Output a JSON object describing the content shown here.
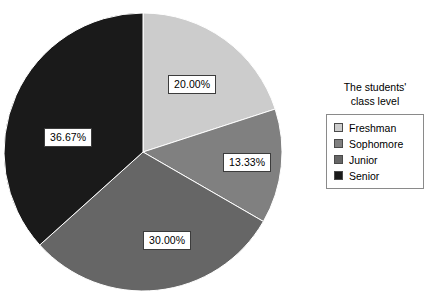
{
  "chart_data": {
    "type": "pie",
    "title": "",
    "legend_title_lines": [
      "The students'",
      "class level"
    ],
    "legend_position": "right",
    "start_angle_deg": 0,
    "direction": "clockwise",
    "categories": [
      "Freshman",
      "Sophomore",
      "Junior",
      "Senior"
    ],
    "values": [
      20.0,
      13.33,
      30.0,
      36.67
    ],
    "value_labels": [
      "20.00%",
      "13.33%",
      "30.00%",
      "36.67%"
    ],
    "colors": [
      "#cccccc",
      "#808080",
      "#666666",
      "#1a1a1a"
    ],
    "slices": [
      {
        "label": "Freshman",
        "value": 20.0,
        "value_label": "20.00%",
        "color": "#cccccc"
      },
      {
        "label": "Sophomore",
        "value": 13.33,
        "value_label": "13.33%",
        "color": "#808080"
      },
      {
        "label": "Junior",
        "value": 30.0,
        "value_label": "30.00%",
        "color": "#666666"
      },
      {
        "label": "Senior",
        "value": 36.67,
        "value_label": "36.67%",
        "color": "#1a1a1a"
      }
    ]
  },
  "legend": {
    "title_line1": "The students'",
    "title_line2": "class level",
    "items": [
      {
        "label": "Freshman",
        "color": "#cccccc"
      },
      {
        "label": "Sophomore",
        "color": "#808080"
      },
      {
        "label": "Junior",
        "color": "#666666"
      },
      {
        "label": "Senior",
        "color": "#1a1a1a"
      }
    ]
  },
  "labels": {
    "freshman_pct": "20.00%",
    "sophomore_pct": "13.33%",
    "junior_pct": "30.00%",
    "senior_pct": "36.67%"
  }
}
